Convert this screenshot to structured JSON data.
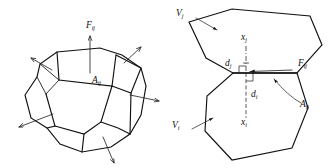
{
  "figure": {
    "domain": "Diagram",
    "background_color": "#ffffff",
    "stroke_color": "#111111",
    "panels": [
      {
        "id": "left-panel",
        "name": "polyhedral-control-volume",
        "description": "Polyhedral control volume with outward face normal arrows"
      },
      {
        "id": "right-panel",
        "name": "adjacent-cells-pair",
        "description": "Two adjacent polygonal cells sharing an interface face"
      }
    ]
  },
  "labels": {
    "left_flux": {
      "base": "F",
      "sub": "ij",
      "x": 90,
      "y": 26
    },
    "left_area": {
      "base": "A",
      "sub": "ij",
      "x": 95,
      "y": 81
    },
    "right_cell_upper": {
      "base": "V",
      "sub": "j",
      "x": 180,
      "y": 14
    },
    "right_cell_lower": {
      "base": "V",
      "sub": "i",
      "x": 176,
      "y": 126
    },
    "right_centroid_upper": {
      "base": "x",
      "sub": "j",
      "x": 242,
      "y": 39
    },
    "right_centroid_lower": {
      "base": "x",
      "sub": "i",
      "x": 243,
      "y": 124
    },
    "right_dist_upper": {
      "base": "d",
      "sub": "j",
      "x": 228,
      "y": 68
    },
    "right_dist_lower": {
      "base": "d",
      "sub": "i",
      "x": 252,
      "y": 98
    },
    "right_flux": {
      "base": "F",
      "sub": "ij",
      "x": 301,
      "y": 64
    },
    "right_area": {
      "base": "A",
      "sub": "ij",
      "x": 303,
      "y": 105
    }
  },
  "geometry": {
    "left_polyhedron": {
      "outer_outline": "M 57,52 L 40,64 L 37,77 L 25,95 L 31,118 L 47,128 L 60,144 L 82,152 L 111,147 L 130,134 L 140,114 L 146,86 L 141,68 L 122,55 L 100,48 L 57,52 Z",
      "top_face": "M 57,52 L 59,79 L 112,85 L 116,55",
      "front_face_left": "M 59,79 L 46,93 L 55,125",
      "front_face_mid": "M 46,93 L 55,125 L 84,133 L 101,121 L 112,85",
      "right_face": "M 112,85 L 131,92 L 141,68",
      "right_face_edge": "M 116,55 L 122,55",
      "left_small_face": "M 40,64 L 59,79 L 46,93 L 37,77",
      "right_top_edge": "M 116,55 L 141,68 L 131,92 L 112,85",
      "lower_right": "M 101,121 L 118,127 L 130,134",
      "lower_mid": "M 84,133 L 82,152",
      "inner_extra": "M 55,125 L 47,128"
    },
    "left_normals": [
      {
        "name": "normal-top",
        "from": [
          90,
          72
        ],
        "to": [
          90,
          36
        ]
      },
      {
        "name": "normal-upper-left",
        "from": [
          50,
          68
        ],
        "to": [
          30,
          58
        ]
      },
      {
        "name": "normal-upper-right",
        "from": [
          123,
          62
        ],
        "to": [
          141,
          47
        ]
      },
      {
        "name": "normal-right",
        "from": [
          131,
          93
        ],
        "to": [
          159,
          101
        ]
      },
      {
        "name": "normal-lower-left",
        "from": [
          52,
          113
        ],
        "to": [
          18,
          127
        ]
      },
      {
        "name": "normal-bottom",
        "from": [
          104,
          137
        ],
        "to": [
          114,
          163
        ]
      }
    ],
    "right_upper_cell": "M 189,22 L 232,9 L 310,16 L 321,45 L 297,73 L 233,73 L 206,58 L 189,22 Z",
    "right_lower_cell": "M 233,73 L 297,73 L 307,108 L 292,147 L 232,160 L 205,131 L 207,96 L 233,73 Z",
    "right_interface": "M 233,73 L 297,73",
    "right_axis_upper": "M 246,45 L 246,73",
    "right_axis_lower": "M 246,73 L 246,118",
    "right_flux_arrow": {
      "from": [
        292,
        70
      ],
      "to": [
        250,
        72
      ]
    },
    "right_angle_upper": {
      "x": 238,
      "y": 65,
      "size": 7
    },
    "right_angle_lower": {
      "x": 246,
      "y": 74,
      "size": 7
    },
    "leader_cell_upper": {
      "from": [
        196,
        18
      ],
      "to": [
        216,
        29
      ]
    },
    "leader_cell_lower": {
      "from": [
        192,
        128
      ],
      "to": [
        212,
        118
      ]
    },
    "leader_area": {
      "from": [
        300,
        104
      ],
      "to": [
        272,
        79
      ]
    }
  }
}
